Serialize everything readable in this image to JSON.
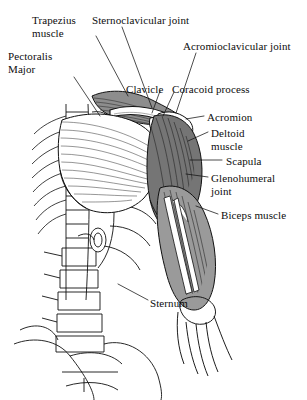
{
  "figure": {
    "background_color": "#ffffff",
    "ink_color": "#0d0d0d",
    "width": 307,
    "height": 400,
    "view": "anterior",
    "style": "black-and-white line engraving with hatched shading"
  },
  "palette": {
    "outline": "#111111",
    "muscle_dark": "#6f6f6f",
    "muscle_mid": "#a8a8a8",
    "muscle_light": "#d6d6d6",
    "bone_fill": "#ffffff",
    "hatch": "#3a3a3a",
    "leader_line": "#111111"
  },
  "labels": [
    {
      "id": "trapezius",
      "text": "Trapezius\nmuscle",
      "lines": [
        "Trapezius",
        "muscle"
      ],
      "x": 32,
      "y": 14,
      "align": "left",
      "leader": [
        [
          96,
          36
        ],
        [
          128,
          96
        ]
      ]
    },
    {
      "id": "sternoclavicular",
      "text": "Sternoclavicular joint",
      "lines": [
        "Sternoclavicular joint"
      ],
      "x": 92,
      "y": 14,
      "align": "left",
      "leader": [
        [
          122,
          27
        ],
        [
          152,
          108
        ]
      ]
    },
    {
      "id": "acromioclavicular",
      "text": "Acromioclavicular joint",
      "lines": [
        "Acromioclavicular joint"
      ],
      "x": 183,
      "y": 40,
      "align": "left",
      "leader": [
        [
          196,
          53
        ],
        [
          176,
          113
        ]
      ]
    },
    {
      "id": "pectoralis-major",
      "text": "Pectoralis\nMajor",
      "lines": [
        "Pectoralis",
        "Major"
      ],
      "x": 8,
      "y": 50,
      "align": "left",
      "leader": [
        [
          74,
          77
        ],
        [
          100,
          116
        ]
      ]
    },
    {
      "id": "clavicle",
      "text": "Clavicle",
      "lines": [
        "Clavicle"
      ],
      "x": 126,
      "y": 83,
      "align": "left",
      "leader": [
        [
          160,
          91
        ],
        [
          152,
          113
        ]
      ]
    },
    {
      "id": "coracoid-process",
      "text": "Coracoid process",
      "lines": [
        "Coracoid process"
      ],
      "x": 172,
      "y": 83,
      "align": "left",
      "leader": [
        [
          174,
          92
        ],
        [
          163,
          116
        ]
      ]
    },
    {
      "id": "acromion",
      "text": "Acromion",
      "lines": [
        "Acromion"
      ],
      "x": 207,
      "y": 111,
      "align": "left",
      "leader": [
        [
          204,
          116
        ],
        [
          186,
          119
        ]
      ]
    },
    {
      "id": "deltoid-muscle",
      "text": "Deltoid\nmuscle",
      "lines": [
        "Deltoid",
        "muscle"
      ],
      "x": 211,
      "y": 127,
      "align": "left",
      "leader": [
        [
          208,
          132
        ],
        [
          188,
          141
        ]
      ]
    },
    {
      "id": "scapula",
      "text": "Scapula",
      "lines": [
        "Scapula"
      ],
      "x": 226,
      "y": 155,
      "align": "left",
      "leader": [
        [
          222,
          160
        ],
        [
          190,
          160
        ]
      ]
    },
    {
      "id": "glenohumeral-joint",
      "text": "Glenohumeral\njoint",
      "lines": [
        "Glenohumeral",
        "joint"
      ],
      "x": 211,
      "y": 172,
      "align": "left",
      "leader": [
        [
          208,
          177
        ],
        [
          186,
          174
        ]
      ]
    },
    {
      "id": "biceps-muscle",
      "text": "Biceps muscle",
      "lines": [
        "Biceps muscle"
      ],
      "x": 221,
      "y": 209,
      "align": "left",
      "leader": [
        [
          218,
          214
        ],
        [
          196,
          206
        ]
      ]
    },
    {
      "id": "sternum",
      "text": "Sternum",
      "lines": [
        "Sternum"
      ],
      "x": 150,
      "y": 297,
      "align": "left",
      "leader": [
        [
          148,
          300
        ],
        [
          118,
          284
        ]
      ]
    }
  ],
  "structures": {
    "skeleton": [
      "cervical and thoracic vertebral column",
      "lumbar vertebrae",
      "pelvis / ilium",
      "ribs",
      "sternum",
      "clavicle",
      "scapula",
      "humerus"
    ],
    "muscles": [
      "trapezius",
      "pectoralis major",
      "deltoid",
      "biceps brachii"
    ]
  }
}
